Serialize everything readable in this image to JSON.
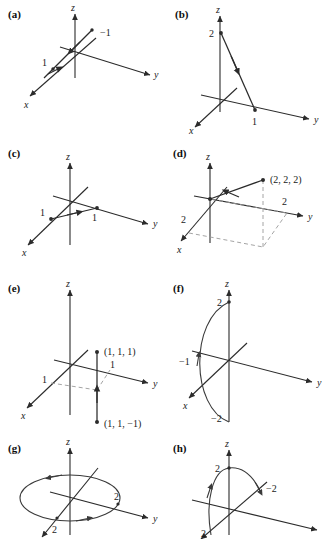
{
  "figure": {
    "background_color": "#ffffff",
    "stroke_color": "#2b2b2b",
    "dash_color": "#9a9a9a",
    "panel_count": 8
  },
  "axis_labels": {
    "x": "x",
    "y": "y",
    "z": "z"
  },
  "panels": [
    {
      "tag": "(a)",
      "description": "Line through origin along direction with marks at 1 and -1",
      "labels": {
        "pos": "1",
        "neg": "−1"
      }
    },
    {
      "tag": "(b)",
      "description": "Segment from z = 2 to y = 1 with direction arrow",
      "labels": {
        "z_value": "2",
        "y_value": "1"
      }
    },
    {
      "tag": "(c)",
      "description": "Vector from x = 1 to y = 1 in the xy-plane",
      "labels": {
        "x_value": "1",
        "y_value": "1"
      }
    },
    {
      "tag": "(d)",
      "description": "Position vector to the point (2, 2, 2) with dashed projection box",
      "labels": {
        "point": "(2, 2, 2)",
        "x_value": "2",
        "y_value": "2"
      }
    },
    {
      "tag": "(e)",
      "description": "Vertical segment between (1, 1, -1) and (1, 1, 1) with dashed guides",
      "labels": {
        "upper_point": "(1, 1, 1)",
        "lower_point": "(1, 1, −1)",
        "x_value": "1",
        "y_value": "1"
      }
    },
    {
      "tag": "(f)",
      "description": "Arc in the xz-plane from z = -2 through x = -1 to z = 2",
      "labels": {
        "z_top": "2",
        "x_value": "−1",
        "z_bottom": "−2"
      }
    },
    {
      "tag": "(g)",
      "description": "Circle of radius 2 in the xy-plane traversed counterclockwise",
      "labels": {
        "x_value": "2",
        "y_value": "2"
      }
    },
    {
      "tag": "(h)",
      "description": "Arc from x = 2 up through z = 2 and down toward y = -2",
      "labels": {
        "z_value": "2",
        "y_value": "−2",
        "x_value": "2"
      }
    }
  ]
}
